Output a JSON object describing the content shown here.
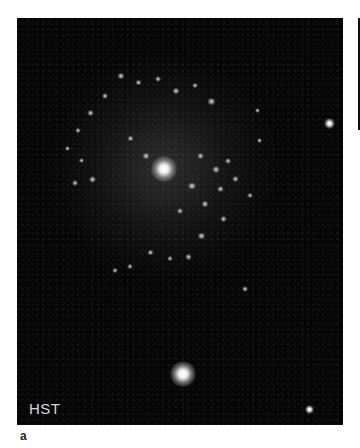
{
  "figure": {
    "panel_label": "a",
    "instrument_label": "HST",
    "colors": {
      "background": "#ffffff",
      "image_background": "#050505",
      "label_text": "#d8d8d8"
    },
    "objects": [
      {
        "type": "galaxy-core",
        "x": 147,
        "y": 151,
        "size": 22
      },
      {
        "type": "star",
        "x": 166,
        "y": 356,
        "size": 22
      },
      {
        "type": "star",
        "x": 313,
        "y": 106,
        "size": 10
      },
      {
        "type": "star",
        "x": 293,
        "y": 392,
        "size": 8
      }
    ]
  }
}
